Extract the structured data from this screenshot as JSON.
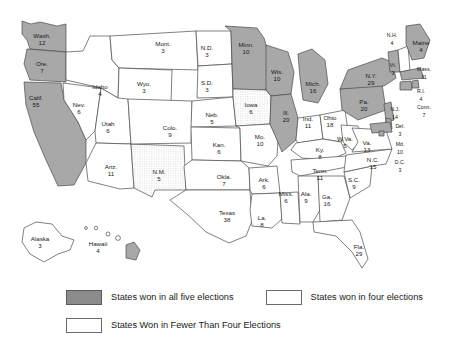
{
  "map": {
    "title": "States won in presidential elections",
    "colors": {
      "won_five": "#a8a8a8",
      "won_four": "#ffffff",
      "won_fewer": "#ffffff",
      "border": "#4a4a4a",
      "background": "#ffffff"
    },
    "categories": {
      "five": "States won in all five elections",
      "four": "States won in four elections",
      "fewer": "States Won in Fewer Than Four Elections"
    },
    "states": [
      {
        "abbr": "Wash.",
        "votes": 12,
        "cat": "five",
        "x": 42,
        "y": 36
      },
      {
        "abbr": "Ore.",
        "votes": 7,
        "cat": "five",
        "x": 42,
        "y": 64
      },
      {
        "abbr": "Calif.",
        "votes": 55,
        "cat": "five",
        "x": 36,
        "y": 98
      },
      {
        "abbr": "Nev.",
        "votes": 6,
        "cat": "fewer",
        "x": 79,
        "y": 105
      },
      {
        "abbr": "Idaho",
        "votes": 4,
        "cat": "fewer",
        "x": 100,
        "y": 87
      },
      {
        "abbr": "Mont.",
        "votes": 3,
        "cat": "fewer",
        "x": 163,
        "y": 44
      },
      {
        "abbr": "Wyo.",
        "votes": 3,
        "cat": "fewer",
        "x": 144,
        "y": 84
      },
      {
        "abbr": "Utah",
        "votes": 6,
        "cat": "fewer",
        "x": 108,
        "y": 124
      },
      {
        "abbr": "Ariz.",
        "votes": 11,
        "cat": "fewer",
        "x": 111,
        "y": 167
      },
      {
        "abbr": "N.M.",
        "votes": 5,
        "cat": "four",
        "x": 159,
        "y": 172
      },
      {
        "abbr": "Colo.",
        "votes": 9,
        "cat": "fewer",
        "x": 170,
        "y": 128
      },
      {
        "abbr": "N.D.",
        "votes": 3,
        "cat": "fewer",
        "x": 207,
        "y": 48
      },
      {
        "abbr": "S.D.",
        "votes": 3,
        "cat": "fewer",
        "x": 207,
        "y": 83
      },
      {
        "abbr": "Neb.",
        "votes": 5,
        "cat": "fewer",
        "x": 212,
        "y": 115
      },
      {
        "abbr": "Kan.",
        "votes": 6,
        "cat": "fewer",
        "x": 219,
        "y": 145
      },
      {
        "abbr": "Okla.",
        "votes": 7,
        "cat": "fewer",
        "x": 224,
        "y": 177
      },
      {
        "abbr": "Texas",
        "votes": 38,
        "cat": "fewer",
        "x": 227,
        "y": 213
      },
      {
        "abbr": "Minn.",
        "votes": 10,
        "cat": "five",
        "x": 246,
        "y": 45
      },
      {
        "abbr": "Iowa",
        "votes": 6,
        "cat": "four",
        "x": 251,
        "y": 105
      },
      {
        "abbr": "Mo.",
        "votes": 10,
        "cat": "fewer",
        "x": 260,
        "y": 137
      },
      {
        "abbr": "Ark.",
        "votes": 6,
        "cat": "fewer",
        "x": 264,
        "y": 180
      },
      {
        "abbr": "La.",
        "votes": 8,
        "cat": "fewer",
        "x": 262,
        "y": 218
      },
      {
        "abbr": "Miss.",
        "votes": 6,
        "cat": "fewer",
        "x": 286,
        "y": 194
      },
      {
        "abbr": "Wis.",
        "votes": 10,
        "cat": "five",
        "x": 277,
        "y": 72
      },
      {
        "abbr": "Ill.",
        "votes": 20,
        "cat": "five",
        "x": 286,
        "y": 113
      },
      {
        "abbr": "Mich.",
        "votes": 16,
        "cat": "five",
        "x": 313,
        "y": 84
      },
      {
        "abbr": "Ind.",
        "votes": 11,
        "cat": "fewer",
        "x": 308,
        "y": 119
      },
      {
        "abbr": "Ohio",
        "votes": 18,
        "cat": "fewer",
        "x": 330,
        "y": 118
      },
      {
        "abbr": "Ky.",
        "votes": 8,
        "cat": "fewer",
        "x": 320,
        "y": 150
      },
      {
        "abbr": "Tenn.",
        "votes": 11,
        "cat": "fewer",
        "x": 320,
        "y": 171
      },
      {
        "abbr": "Ala.",
        "votes": 9,
        "cat": "fewer",
        "x": 306,
        "y": 194
      },
      {
        "abbr": "Ga.",
        "votes": 16,
        "cat": "fewer",
        "x": 327,
        "y": 197
      },
      {
        "abbr": "Fla.",
        "votes": 29,
        "cat": "fewer",
        "x": 359,
        "y": 247
      },
      {
        "abbr": "S.C.",
        "votes": 9,
        "cat": "fewer",
        "x": 354,
        "y": 180
      },
      {
        "abbr": "N.C.",
        "votes": 15,
        "cat": "fewer",
        "x": 373,
        "y": 160
      },
      {
        "abbr": "W.Va.",
        "votes": 5,
        "cat": "fewer",
        "x": 345,
        "y": 139
      },
      {
        "abbr": "Va.",
        "votes": 13,
        "cat": "fewer",
        "x": 367,
        "y": 143
      },
      {
        "abbr": "Pa.",
        "votes": 20,
        "cat": "five",
        "x": 364,
        "y": 102
      },
      {
        "abbr": "N.Y.",
        "votes": 29,
        "cat": "five",
        "x": 371,
        "y": 76
      },
      {
        "abbr": "Vt.",
        "votes": 3,
        "cat": "five",
        "x": 393,
        "y": 66
      },
      {
        "abbr": "N.H.",
        "votes": 4,
        "cat": "fewer",
        "x": 392,
        "y": 36
      },
      {
        "abbr": "Maine",
        "votes": 4,
        "cat": "five",
        "x": 421,
        "y": 43
      },
      {
        "abbr": "Mass.",
        "votes": 11,
        "cat": "five",
        "x": 424,
        "y": 70
      },
      {
        "abbr": "R.I.",
        "votes": 4,
        "cat": "five",
        "x": 421,
        "y": 92
      },
      {
        "abbr": "Conn.",
        "votes": 7,
        "cat": "five",
        "x": 424,
        "y": 108
      },
      {
        "abbr": "N.J.",
        "votes": 14,
        "cat": "five",
        "x": 395,
        "y": 110
      },
      {
        "abbr": "Del.",
        "votes": 3,
        "cat": "five",
        "x": 400,
        "y": 127
      },
      {
        "abbr": "Md.",
        "votes": 10,
        "cat": "five",
        "x": 400,
        "y": 145
      },
      {
        "abbr": "D.C.",
        "votes": 3,
        "cat": "five",
        "x": 400,
        "y": 163
      },
      {
        "abbr": "Alaska",
        "votes": 3,
        "cat": "fewer",
        "x": 40,
        "y": 239
      },
      {
        "abbr": "Hawaii",
        "votes": 4,
        "cat": "five",
        "x": 98,
        "y": 244
      }
    ]
  }
}
